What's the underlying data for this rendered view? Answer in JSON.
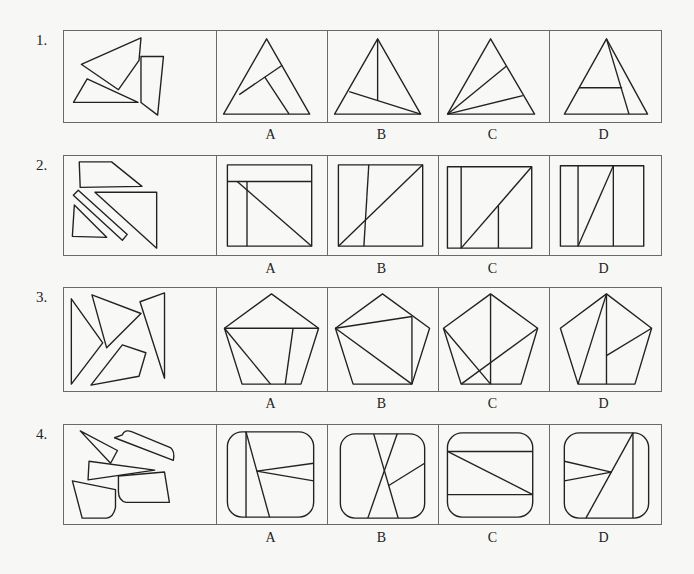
{
  "questions": [
    {
      "number": "1.",
      "options": [
        "A",
        "B",
        "C",
        "D"
      ],
      "shape": "triangle"
    },
    {
      "number": "2.",
      "options": [
        "A",
        "B",
        "C",
        "D"
      ],
      "shape": "square"
    },
    {
      "number": "3.",
      "options": [
        "A",
        "B",
        "C",
        "D"
      ],
      "shape": "pentagon"
    },
    {
      "number": "4.",
      "options": [
        "A",
        "B",
        "C",
        "D"
      ],
      "shape": "rounded-square"
    }
  ]
}
